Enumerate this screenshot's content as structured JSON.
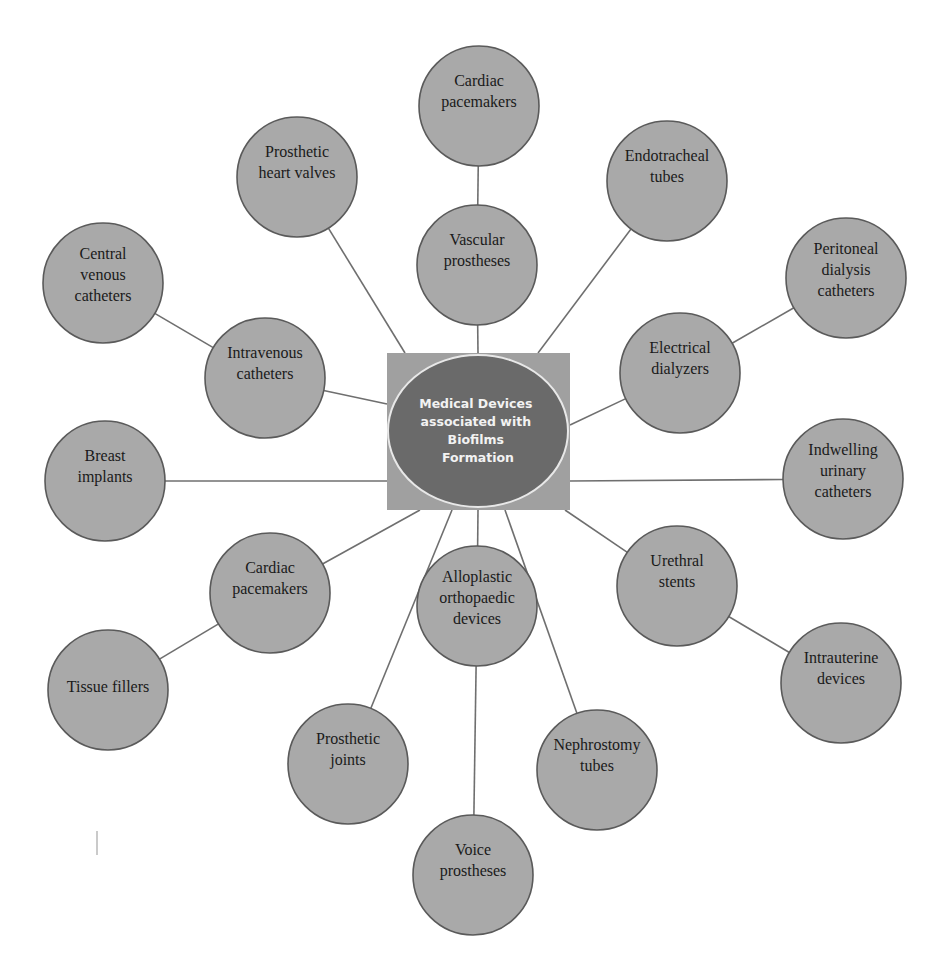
{
  "colors": {
    "node_fill": "#a9a9a9",
    "center_box_fill": "#a0a0a0",
    "center_ellipse_fill": "#6a6a6a",
    "center_ellipse_stroke": "#e8e8e8",
    "edge": "#6f6f6f",
    "background": "#ffffff"
  },
  "center": {
    "lines": [
      "Medical Devices",
      "associated with",
      "Biofilms",
      "Formation"
    ]
  },
  "nodes": [
    {
      "id": "cardiac-pacemakers-top",
      "lines": [
        "Cardiac",
        "pacemakers"
      ],
      "parent": "vascular-prostheses"
    },
    {
      "id": "vascular-prostheses",
      "lines": [
        "Vascular",
        "prostheses"
      ],
      "parent": "center"
    },
    {
      "id": "prosthetic-heart-valves",
      "lines": [
        "Prosthetic",
        "heart valves"
      ],
      "parent": "center"
    },
    {
      "id": "endotracheal-tubes",
      "lines": [
        "Endotracheal",
        "tubes"
      ],
      "parent": "center"
    },
    {
      "id": "central-venous-catheters",
      "lines": [
        "Central",
        "venous",
        "catheters"
      ],
      "parent": "intravenous-catheters"
    },
    {
      "id": "intravenous-catheters",
      "lines": [
        "Intravenous",
        "catheters"
      ],
      "parent": "center"
    },
    {
      "id": "peritoneal-dialysis-catheters",
      "lines": [
        "Peritoneal",
        "dialysis",
        "catheters"
      ],
      "parent": "electrical-dialyzers"
    },
    {
      "id": "electrical-dialyzers",
      "lines": [
        "Electrical",
        "dialyzers"
      ],
      "parent": "center"
    },
    {
      "id": "breast-implants",
      "lines": [
        "Breast",
        "implants"
      ],
      "parent": "center"
    },
    {
      "id": "indwelling-urinary-catheters",
      "lines": [
        "Indwelling",
        "urinary",
        "catheters"
      ],
      "parent": "center"
    },
    {
      "id": "cardiac-pacemakers-left",
      "lines": [
        "Cardiac",
        "pacemakers"
      ],
      "parent": "center"
    },
    {
      "id": "urethral-stents",
      "lines": [
        "Urethral",
        "stents"
      ],
      "parent": "center"
    },
    {
      "id": "tissue-fillers",
      "lines": [
        "Tissue fillers"
      ],
      "parent": "cardiac-pacemakers-left"
    },
    {
      "id": "alloplastic-orthopaedic-devices",
      "lines": [
        "Alloplastic",
        "orthopaedic",
        "devices"
      ],
      "parent": "center"
    },
    {
      "id": "intrauterine-devices",
      "lines": [
        "Intrauterine",
        "devices"
      ],
      "parent": "urethral-stents"
    },
    {
      "id": "prosthetic-joints",
      "lines": [
        "Prosthetic",
        "joints"
      ],
      "parent": "center"
    },
    {
      "id": "nephrostomy-tubes",
      "lines": [
        "Nephrostomy",
        "tubes"
      ],
      "parent": "center"
    },
    {
      "id": "voice-prostheses",
      "lines": [
        "Voice",
        "prostheses"
      ],
      "parent": "alloplastic-orthopaedic-devices"
    }
  ]
}
